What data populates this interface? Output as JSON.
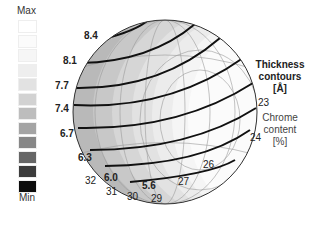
{
  "chart_data": {
    "type": "heatmap",
    "title": "Thickness contours [Å]",
    "subtitle": "Chrome content [%]",
    "projection": "sphere (pole figure style)",
    "colorbar": {
      "max_label": "Max",
      "min_label": "Min",
      "levels": [
        "#ffffff",
        "#fbfbfb",
        "#f6f6f6",
        "#eeeeee",
        "#e2e2e2",
        "#d2d2d2",
        "#bdbdbd",
        "#a4a4a4",
        "#878787",
        "#666666",
        "#3c3c3c",
        "#0c0c0c"
      ]
    },
    "thickness_contours": [
      {
        "value": "8.4"
      },
      {
        "value": "8.1"
      },
      {
        "value": "7.7"
      },
      {
        "value": "7.4"
      },
      {
        "value": "6.7"
      },
      {
        "value": "6.3"
      },
      {
        "value": "6.0"
      },
      {
        "value": "5.6"
      }
    ],
    "chrome_content_labels": [
      "23",
      "24",
      "26",
      "27",
      "29",
      "30",
      "31",
      "32"
    ]
  },
  "labels": {
    "max": "Max",
    "min": "Min",
    "thickness_title_line1": "Thickness",
    "thickness_title_line2": "contours",
    "thickness_unit": "[Å]",
    "chrome_line1": "Chrome",
    "chrome_line2": "content",
    "chrome_unit": "[%]"
  }
}
